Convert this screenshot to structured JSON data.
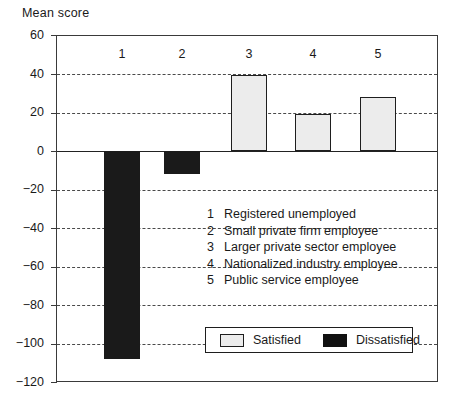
{
  "chart_data": {
    "type": "bar",
    "title": "",
    "ylabel": "Mean score",
    "xlabel": "",
    "ylim": [
      -120,
      60
    ],
    "ytick_labels": [
      "60",
      "40",
      "20",
      "0",
      "−20",
      "−40",
      "−60",
      "−80",
      "−100",
      "−120"
    ],
    "ytick_values": [
      60,
      40,
      20,
      0,
      -20,
      -40,
      -60,
      -80,
      -100,
      -120
    ],
    "grid": "horizontal-dashed",
    "zero_line": true,
    "legend_position": "bottom-center",
    "categories": [
      "1",
      "2",
      "3",
      "4",
      "5"
    ],
    "category_numbers": [
      "1",
      "2",
      "3",
      "4",
      "5"
    ],
    "series": [
      {
        "name": "Satisfied",
        "color": "#ececec",
        "values": [
          null,
          null,
          39,
          19,
          28
        ]
      },
      {
        "name": "Dissatisfied",
        "color": "#1a1a1a",
        "values": [
          -108,
          -12,
          null,
          null,
          null
        ]
      }
    ],
    "bars": [
      {
        "category": "1",
        "value": -108,
        "series": "Dissatisfied"
      },
      {
        "category": "2",
        "value": -12,
        "series": "Dissatisfied"
      },
      {
        "category": "3",
        "value": 39,
        "series": "Satisfied"
      },
      {
        "category": "4",
        "value": 19,
        "series": "Satisfied"
      },
      {
        "category": "5",
        "value": 28,
        "series": "Satisfied"
      }
    ],
    "annotations": [
      {
        "num": "1",
        "label": "Registered unemployed"
      },
      {
        "num": "2",
        "label": "Small private firm employee"
      },
      {
        "num": "3",
        "label": "Larger private sector employee"
      },
      {
        "num": "4",
        "label": "Nationalized industry employee"
      },
      {
        "num": "5",
        "label": "Public service employee"
      }
    ],
    "legend": [
      {
        "label": "Satisfied",
        "color": "#ececec"
      },
      {
        "label": "Dissatisfied",
        "color": "#1a1a1a"
      }
    ]
  }
}
